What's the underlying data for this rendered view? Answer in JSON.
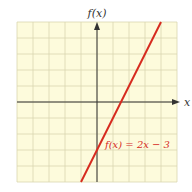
{
  "chart_data": {
    "type": "line",
    "title": "",
    "xlabel": "x",
    "ylabel": "f(x)",
    "xlim": [
      -5,
      5
    ],
    "ylim": [
      -5,
      5
    ],
    "grid": true,
    "series": [
      {
        "name": "f(x) = 2x − 3",
        "color": "#d62a1e",
        "x": [
          -1,
          4
        ],
        "y": [
          -5,
          5
        ]
      }
    ],
    "annotations": [
      {
        "text": "f(x) = 2x − 3",
        "x": 0.9,
        "y": -3.6
      }
    ]
  },
  "colors": {
    "background": "#fdfbdc",
    "grid": "#d9d7b0",
    "axis": "#333333",
    "line": "#d62a1e"
  }
}
